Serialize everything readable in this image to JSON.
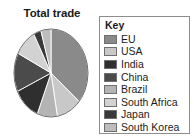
{
  "chart_title": "Total trade",
  "legend": {
    "heading": "Key"
  },
  "chart_data": {
    "type": "pie",
    "title": "Total trade",
    "xlabel": "",
    "ylabel": "",
    "legend_position": "right",
    "grid": false,
    "start_angle_deg": 0,
    "direction": "clockwise",
    "categories": [
      "EU",
      "USA",
      "India",
      "China",
      "Brazil",
      "South Africa",
      "Japan",
      "South Korea"
    ],
    "values": [
      33,
      10,
      11,
      13,
      8,
      9,
      3,
      4
    ],
    "slice_order_clockwise_from_top": [
      "EU",
      "USA",
      "Brazil",
      "India",
      "China",
      "South Africa",
      "Japan",
      "South Korea"
    ],
    "colors": {
      "EU": "#8a8a8a",
      "USA": "#c8c8c8",
      "India": "#2f2f2f",
      "China": "#4b4b4b",
      "Brazil": "#b4b4b4",
      "South Africa": "#d2d2d2",
      "Japan": "#3a3a3a",
      "South Korea": "#bdbdbd"
    },
    "series": [
      {
        "name": "Total trade",
        "values": [
          33,
          10,
          11,
          13,
          8,
          9,
          3,
          4
        ]
      }
    ],
    "legend_entries": [
      {
        "label": "EU",
        "color": "#8a8a8a",
        "value": 33
      },
      {
        "label": "USA",
        "color": "#c8c8c8",
        "value": 10
      },
      {
        "label": "India",
        "color": "#2f2f2f",
        "value": 11
      },
      {
        "label": "China",
        "color": "#4b4b4b",
        "value": 13
      },
      {
        "label": "Brazil",
        "color": "#b4b4b4",
        "value": 8
      },
      {
        "label": "South Africa",
        "color": "#d2d2d2",
        "value": 9
      },
      {
        "label": "Japan",
        "color": "#3a3a3a",
        "value": 3
      },
      {
        "label": "South Korea",
        "color": "#bdbdbd",
        "value": 4
      }
    ],
    "geometry": {
      "center_x": 38,
      "center_y": 45,
      "radius_x": 37,
      "radius_y": 44
    }
  }
}
